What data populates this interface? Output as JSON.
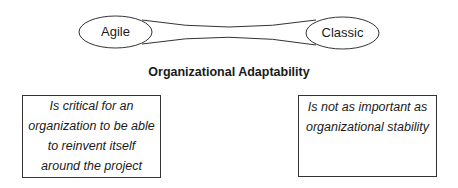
{
  "diagram": {
    "left_pole": {
      "label": "Agile"
    },
    "right_pole": {
      "label": "Classic"
    },
    "dimension_title": "Organizational Adaptability",
    "left_statement": {
      "text": "Is critical for an organization to be able to reinvent itself around the project"
    },
    "right_statement": {
      "text": "Is not as important as organizational stability"
    }
  }
}
